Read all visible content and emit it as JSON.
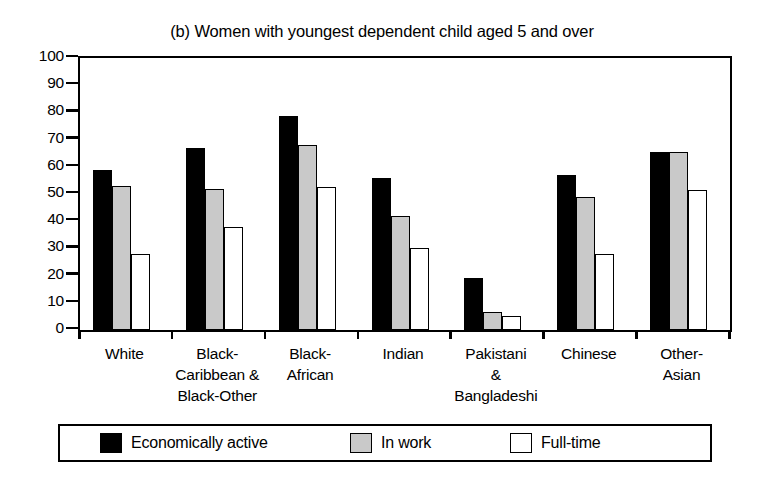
{
  "chart_data": {
    "type": "bar",
    "title": "(b) Women with youngest dependent child aged 5 and over",
    "xlabel": "",
    "ylabel": "",
    "ylim": [
      0,
      100
    ],
    "ytick_step": 10,
    "yticks": [
      "100",
      "90",
      "80",
      "70",
      "60",
      "50",
      "40",
      "30",
      "20",
      "10",
      "0"
    ],
    "grid": false,
    "legend_position": "bottom",
    "categories": [
      "White",
      "Black-\nCaribbean &\nBlack-Other",
      "Black-\nAfrican",
      "Indian",
      "Pakistani\n&\nBangladeshi",
      "Chinese",
      "Other-\nAsian"
    ],
    "series": [
      {
        "name": "Economically active",
        "color": "#000000",
        "values": [
          59,
          67,
          78.5,
          56,
          19,
          57,
          65.5
        ]
      },
      {
        "name": "In work",
        "color": "#c9c9c9",
        "values": [
          53,
          52,
          68,
          42,
          6.5,
          49,
          65.5
        ]
      },
      {
        "name": "Full-time",
        "color": "#ffffff",
        "values": [
          28,
          38,
          52.5,
          30,
          5,
          28,
          51.5
        ]
      }
    ]
  },
  "legend": {
    "entries": [
      {
        "label": "Economically active"
      },
      {
        "label": "In work"
      },
      {
        "label": "Full-time"
      }
    ]
  }
}
